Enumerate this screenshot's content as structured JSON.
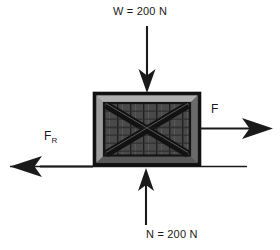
{
  "diagram": {
    "background_color": "#ffffff",
    "ink_color": "#1a1a1a",
    "ground": {
      "name": "ground-line",
      "x1": 10,
      "x2": 247,
      "y": 166
    },
    "crate": {
      "name": "crate",
      "x": 93,
      "y": 92,
      "width": 108,
      "height": 74,
      "outer_frame_color": "#1c1c1c",
      "bevel_light_color": "#9a9a9a",
      "bevel_mid_color": "#6e6e6e",
      "panel_color": "#3a3a3a",
      "brace_color": "#161616"
    },
    "forces": [
      {
        "name": "weight-force",
        "label": "W = 200 N",
        "symbol": "W",
        "magnitude": "200",
        "unit": "N",
        "direction": "down",
        "arrow": {
          "x": 147,
          "y_start": 26,
          "y_end": 92
        }
      },
      {
        "name": "normal-force",
        "label": "N = 200 N",
        "symbol": "N",
        "magnitude": "200",
        "unit": "N",
        "direction": "up",
        "arrow": {
          "x": 146,
          "y_start": 225,
          "y_end": 168
        }
      },
      {
        "name": "applied-force",
        "label": "F",
        "symbol": "F",
        "magnitude": "",
        "unit": "",
        "direction": "right",
        "arrow": {
          "y": 128,
          "x_start": 200,
          "x_end": 272
        }
      },
      {
        "name": "friction-force",
        "label_main": "F",
        "label_sub": "R",
        "symbol": "F_R",
        "magnitude": "",
        "unit": "",
        "direction": "left",
        "arrow": {
          "y": 166,
          "x_start": 90,
          "x_end": 10
        }
      }
    ]
  }
}
